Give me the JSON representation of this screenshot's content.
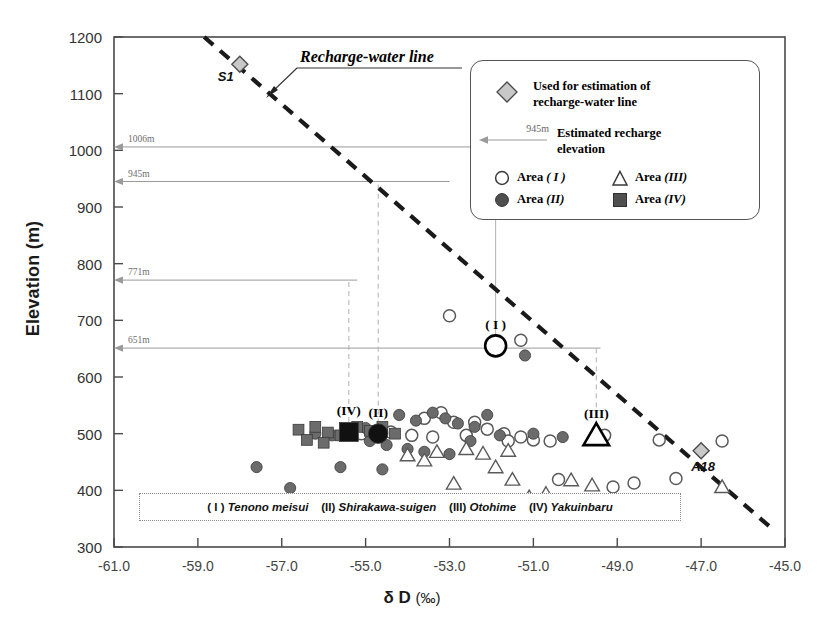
{
  "axes": {
    "ylabel": "Elevation (m)",
    "xlabel_main": "δ D",
    "xlabel_unit": "(‰)",
    "yticks": [
      300,
      400,
      500,
      600,
      700,
      800,
      900,
      1000,
      1100,
      1200
    ],
    "xticks": [
      "-61.0",
      "-59.0",
      "-57.0",
      "-55.0",
      "-53.0",
      "-51.0",
      "-49.0",
      "-47.0",
      "-45.0"
    ],
    "xlim": [
      -61.0,
      -45.0
    ],
    "ylim": [
      300,
      1200
    ]
  },
  "annotations": {
    "recharge_line_label": "Recharge-water line",
    "elevation_arrows": [
      {
        "label": "1006m",
        "elevation": 1006,
        "from_x": -51.6
      },
      {
        "label": "945m",
        "elevation": 945,
        "from_x": -53.0
      },
      {
        "label": "771m",
        "elevation": 771,
        "from_x": -55.2
      },
      {
        "label": "651m",
        "elevation": 651,
        "from_x": -49.4
      }
    ],
    "named_points": [
      {
        "name": "S1",
        "x": -58.0,
        "y": 1152
      },
      {
        "name": "R1",
        "x": -52.2,
        "y": 905
      },
      {
        "name": "A18",
        "x": -47.0,
        "y": 470
      }
    ],
    "group_markers": [
      {
        "label": "( I )",
        "x": -51.9,
        "y": 655,
        "marker": "open-circle",
        "drop_to": 1006
      },
      {
        "label": "(II)",
        "x": -54.7,
        "y": 500,
        "marker": "filled-circle",
        "drop_to": 945
      },
      {
        "label": "(III)",
        "x": -49.5,
        "y": 497,
        "marker": "open-triangle",
        "drop_to": 651
      },
      {
        "label": "(IV)",
        "x": -55.4,
        "y": 503,
        "marker": "filled-square",
        "drop_to": 771
      }
    ]
  },
  "legend": {
    "diamond_label_line1": "Used for estimation of",
    "diamond_label_line2": "recharge-water line",
    "arrow_value": "945m",
    "arrow_label_line1": "Estimated recharge",
    "arrow_label_line2": "elevation",
    "areas": [
      {
        "marker": "open-circle",
        "label": "Area",
        "roman": "( I )"
      },
      {
        "marker": "open-triangle",
        "label": "Area",
        "roman": "(III)"
      },
      {
        "marker": "filled-circle",
        "label": "Area",
        "roman": "(II)"
      },
      {
        "marker": "filled-square",
        "label": "Area",
        "roman": "(IV)"
      }
    ]
  },
  "footnote": {
    "items": [
      {
        "roman": "( I )",
        "name": "Tenono meisui"
      },
      {
        "roman": "(II)",
        "name": "Shirakawa-suigen"
      },
      {
        "roman": "(III)",
        "name": "Otohime"
      },
      {
        "roman": "(IV)",
        "name": "Yakuinbaru"
      }
    ]
  },
  "colors": {
    "frame": "#4a4a4a",
    "dashed_line": "#1a1a1a",
    "filled_marker": "#6b6b6b",
    "open_marker": "#5a5a5a",
    "arrow_gray": "#9a9a9a",
    "diamond_fill": "#c8c8c8"
  },
  "chart_data": {
    "type": "scatter",
    "title": "",
    "xlabel": "δ D (‰)",
    "ylabel": "Elevation (m)",
    "xlim": [
      -61.0,
      -45.0
    ],
    "ylim": [
      300,
      1200
    ],
    "grid": false,
    "legend_position": "top-right",
    "trendline": {
      "name": "Recharge-water line",
      "style": "dashed",
      "x": [
        -58.85,
        -45.35
      ],
      "y": [
        1200,
        335
      ]
    },
    "series": [
      {
        "name": "Used for estimation of recharge-water line",
        "marker": "diamond",
        "points": [
          {
            "x": -58.0,
            "y": 1152,
            "label": "S1"
          },
          {
            "x": -52.2,
            "y": 905,
            "label": "R1"
          },
          {
            "x": -47.0,
            "y": 470,
            "label": "A18"
          }
        ]
      },
      {
        "name": "Area ( I )",
        "marker": "open-circle",
        "points": [
          {
            "x": -53.0,
            "y": 708
          },
          {
            "x": -51.9,
            "y": 655
          },
          {
            "x": -51.3,
            "y": 665
          },
          {
            "x": -53.2,
            "y": 537
          },
          {
            "x": -53.6,
            "y": 527
          },
          {
            "x": -52.9,
            "y": 520
          },
          {
            "x": -52.4,
            "y": 520
          },
          {
            "x": -52.1,
            "y": 508
          },
          {
            "x": -51.7,
            "y": 500
          },
          {
            "x": -51.3,
            "y": 494
          },
          {
            "x": -51.0,
            "y": 489
          },
          {
            "x": -50.6,
            "y": 487
          },
          {
            "x": -49.3,
            "y": 497
          },
          {
            "x": -48.0,
            "y": 489
          },
          {
            "x": -46.5,
            "y": 487
          },
          {
            "x": -54.4,
            "y": 503
          },
          {
            "x": -53.9,
            "y": 497
          },
          {
            "x": -53.4,
            "y": 494
          },
          {
            "x": -55.1,
            "y": 500
          },
          {
            "x": -50.4,
            "y": 419
          },
          {
            "x": -49.1,
            "y": 406
          },
          {
            "x": -48.6,
            "y": 413
          },
          {
            "x": -47.6,
            "y": 421
          },
          {
            "x": -50.9,
            "y": 378
          },
          {
            "x": -52.6,
            "y": 497
          },
          {
            "x": -51.6,
            "y": 487
          }
        ]
      },
      {
        "name": "Area (II)",
        "marker": "filled-circle",
        "points": [
          {
            "x": -51.2,
            "y": 638
          },
          {
            "x": -54.7,
            "y": 500
          },
          {
            "x": -54.2,
            "y": 533
          },
          {
            "x": -53.8,
            "y": 523
          },
          {
            "x": -53.4,
            "y": 537
          },
          {
            "x": -53.1,
            "y": 527
          },
          {
            "x": -52.8,
            "y": 518
          },
          {
            "x": -52.4,
            "y": 512
          },
          {
            "x": -52.1,
            "y": 533
          },
          {
            "x": -55.0,
            "y": 510
          },
          {
            "x": -55.4,
            "y": 505
          },
          {
            "x": -55.8,
            "y": 497
          },
          {
            "x": -56.2,
            "y": 500
          },
          {
            "x": -54.9,
            "y": 487
          },
          {
            "x": -54.5,
            "y": 480
          },
          {
            "x": -54.0,
            "y": 473
          },
          {
            "x": -53.6,
            "y": 468
          },
          {
            "x": -57.6,
            "y": 441
          },
          {
            "x": -56.8,
            "y": 404
          },
          {
            "x": -55.6,
            "y": 441
          },
          {
            "x": -54.6,
            "y": 437
          },
          {
            "x": -52.5,
            "y": 487
          },
          {
            "x": -51.8,
            "y": 497
          },
          {
            "x": -51.0,
            "y": 500
          },
          {
            "x": -50.3,
            "y": 494
          },
          {
            "x": -53.0,
            "y": 464
          }
        ]
      },
      {
        "name": "Area (III)",
        "marker": "open-triangle",
        "points": [
          {
            "x": -49.5,
            "y": 497
          },
          {
            "x": -52.6,
            "y": 473
          },
          {
            "x": -52.2,
            "y": 465
          },
          {
            "x": -51.6,
            "y": 470
          },
          {
            "x": -53.3,
            "y": 468
          },
          {
            "x": -54.0,
            "y": 462
          },
          {
            "x": -53.6,
            "y": 453
          },
          {
            "x": -51.9,
            "y": 441
          },
          {
            "x": -51.5,
            "y": 419
          },
          {
            "x": -52.9,
            "y": 412
          },
          {
            "x": -53.9,
            "y": 366
          },
          {
            "x": -52.7,
            "y": 372
          },
          {
            "x": -50.1,
            "y": 418
          },
          {
            "x": -49.6,
            "y": 409
          },
          {
            "x": -46.5,
            "y": 406
          },
          {
            "x": -51.1,
            "y": 388
          },
          {
            "x": -50.7,
            "y": 394
          }
        ]
      },
      {
        "name": "Area (IV)",
        "marker": "filled-square",
        "points": [
          {
            "x": -55.4,
            "y": 503
          },
          {
            "x": -56.6,
            "y": 507
          },
          {
            "x": -56.2,
            "y": 512
          },
          {
            "x": -55.9,
            "y": 502
          },
          {
            "x": -55.6,
            "y": 497
          },
          {
            "x": -56.4,
            "y": 489
          },
          {
            "x": -56.0,
            "y": 484
          },
          {
            "x": -55.2,
            "y": 512
          },
          {
            "x": -54.9,
            "y": 505
          },
          {
            "x": -54.6,
            "y": 512
          },
          {
            "x": -54.3,
            "y": 500
          }
        ]
      }
    ]
  }
}
